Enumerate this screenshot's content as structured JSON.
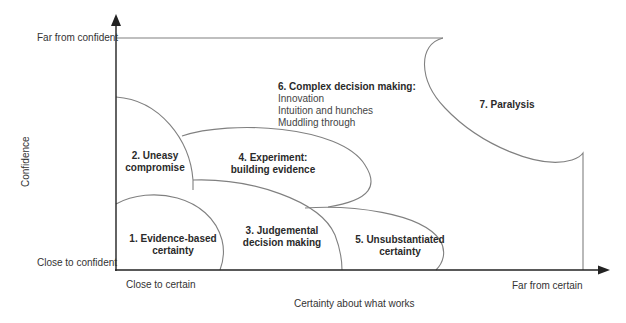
{
  "axes": {
    "y_title": "Confidence",
    "y_top": "Far from confident",
    "y_bottom": "Close to confident",
    "x_title": "Certainty about what works",
    "x_left": "Close to certain",
    "x_right": "Far from certain"
  },
  "regions": [
    {
      "id": 1,
      "line1": "1. Evidence-based",
      "line2": "certainty"
    },
    {
      "id": 2,
      "line1": "2. Uneasy",
      "line2": "compromise"
    },
    {
      "id": 3,
      "line1": "3. Judgemental",
      "line2": "decision making"
    },
    {
      "id": 4,
      "line1": "4. Experiment:",
      "line2": "building evidence"
    },
    {
      "id": 5,
      "line1": "5. Unsubstantiated",
      "line2": "certainty"
    },
    {
      "id": 6,
      "title": "6. Complex decision making:",
      "items": [
        "Innovation",
        "Intuition and hunches",
        "Muddling through"
      ]
    },
    {
      "id": 7,
      "line1": "7. Paralysis"
    }
  ],
  "colors": {
    "axis": "#222222",
    "curve": "#777777",
    "text": "#2a2a2a"
  }
}
